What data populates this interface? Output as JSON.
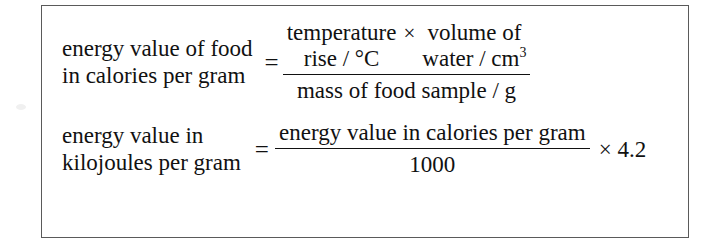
{
  "document": {
    "type": "formula-box",
    "background_color": "#ffffff",
    "border_color": "#5a5a5a",
    "text_color": "#111111"
  },
  "equations": [
    {
      "id": "energy-value-calories-per-gram",
      "lhs_line1": "energy value of food",
      "lhs_line2": "in calories per gram",
      "equals": "=",
      "numerator": {
        "left_line1": "temperature",
        "left_line2": "rise / °C",
        "operator": "×",
        "right_line1": "volume of",
        "right_line2_text": "water / cm",
        "right_line2_sup": "3"
      },
      "denominator": "mass of food sample / g"
    },
    {
      "id": "energy-value-kilojoules-per-gram",
      "lhs_line1": "energy value in",
      "lhs_line2": "kilojoules per gram",
      "equals": "=",
      "numerator_line1": "energy value in",
      "numerator_line2": "calories per gram",
      "denominator": "1000",
      "factor": "× 4.2"
    }
  ]
}
